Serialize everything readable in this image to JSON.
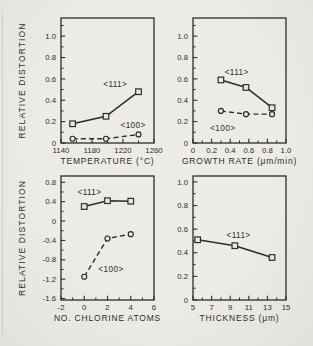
{
  "figure": {
    "background": "#eae8e3",
    "ink": "#2f2d29",
    "y_axis_title": "RELATIVE DISTORTION"
  },
  "chart_data": [
    {
      "id": "temperature",
      "type": "line",
      "title": "",
      "xlabel": "TEMPERATURE (°C)",
      "ylabel": "RELATIVE DISTORTION",
      "xlim": [
        1140,
        1260
      ],
      "ylim": [
        0,
        1.17
      ],
      "grid": false,
      "legend": "inline-annotations",
      "xticks_major": [
        1140,
        1180,
        1220,
        1260
      ],
      "xtick_labels": [
        "1140",
        "1180",
        "1220",
        "1260"
      ],
      "xticks_minor": [
        1160,
        1200,
        1240
      ],
      "yticks_major": [
        0,
        0.2,
        0.4,
        0.6,
        0.8,
        1.0
      ],
      "ytick_labels": [
        "0",
        "0.2",
        "0.4",
        "0.6",
        "0.8",
        "1.0"
      ],
      "yticks_minor": [
        0.1,
        0.3,
        0.5,
        0.7,
        0.9,
        1.1
      ],
      "series": [
        {
          "name": "<111>",
          "marker": "square",
          "dash": false,
          "x": [
            1155,
            1198,
            1240
          ],
          "y": [
            0.18,
            0.25,
            0.48
          ]
        },
        {
          "name": "<100>",
          "marker": "circle",
          "dash": true,
          "x": [
            1155,
            1198,
            1240
          ],
          "y": [
            0.04,
            0.04,
            0.08
          ]
        }
      ],
      "annotations": [
        {
          "text": "<111>",
          "x": 1210,
          "y": 0.55
        },
        {
          "text": "<100>",
          "x": 1233,
          "y": 0.17
        }
      ]
    },
    {
      "id": "growth-rate",
      "type": "line",
      "title": "",
      "xlabel": "GROWTH RATE (μm/min)",
      "ylabel": "",
      "xlim": [
        0,
        1.0
      ],
      "ylim": [
        0,
        1.17
      ],
      "grid": false,
      "legend": "inline-annotations",
      "xticks_major": [
        0,
        0.2,
        0.4,
        0.6,
        0.8,
        1.0
      ],
      "xtick_labels": [
        "0",
        "0.2",
        "0.4",
        "0.6",
        "0.8",
        "1.0"
      ],
      "xticks_minor": [
        0.1,
        0.3,
        0.5,
        0.7,
        0.9
      ],
      "yticks_major": [
        0,
        0.2,
        0.4,
        0.6,
        0.8,
        1.0
      ],
      "ytick_labels": [
        "0",
        "0.2",
        "0.4",
        "0.6",
        "0.8",
        "1.0"
      ],
      "yticks_minor": [
        0.1,
        0.3,
        0.5,
        0.7,
        0.9,
        1.1
      ],
      "series": [
        {
          "name": "<111>",
          "marker": "square",
          "dash": false,
          "x": [
            0.3,
            0.57,
            0.85
          ],
          "y": [
            0.59,
            0.52,
            0.33
          ]
        },
        {
          "name": "<100>",
          "marker": "circle",
          "dash": true,
          "x": [
            0.3,
            0.57,
            0.85
          ],
          "y": [
            0.3,
            0.27,
            0.27
          ]
        }
      ],
      "annotations": [
        {
          "text": "<111>",
          "x": 0.47,
          "y": 0.66
        },
        {
          "text": "<100>",
          "x": 0.32,
          "y": 0.135
        }
      ]
    },
    {
      "id": "chlorine-atoms",
      "type": "line",
      "title": "",
      "xlabel": "NO. CHLORINE ATOMS",
      "ylabel": "RELATIVE DISTORTION",
      "xlim": [
        -2,
        6
      ],
      "ylim": [
        -1.63,
        0.93
      ],
      "grid": false,
      "legend": "inline-annotations",
      "xticks_major": [
        -2,
        0,
        2,
        4,
        6
      ],
      "xtick_labels": [
        "-2",
        "0",
        "2",
        "4",
        "6"
      ],
      "xticks_minor": [
        -1,
        1,
        3,
        5
      ],
      "yticks_major": [
        0.8,
        0.4,
        0,
        -0.4,
        -0.8,
        -1.2,
        -1.6
      ],
      "ytick_labels": [
        "0.8",
        "0.4",
        "0",
        "-0.4",
        "-0.8",
        "-1.2",
        "-1.6"
      ],
      "yticks_minor": [
        0.6,
        0.2,
        -0.2,
        -0.6,
        -1.0,
        -1.4
      ],
      "series": [
        {
          "name": "<111>",
          "marker": "square",
          "dash": false,
          "x": [
            0,
            2,
            4
          ],
          "y": [
            0.3,
            0.42,
            0.41
          ]
        },
        {
          "name": "<100>",
          "marker": "circle",
          "dash": true,
          "x": [
            0,
            2,
            4
          ],
          "y": [
            -1.15,
            -0.36,
            -0.27
          ]
        }
      ],
      "annotations": [
        {
          "text": "<111>",
          "x": 0.45,
          "y": 0.6
        },
        {
          "text": "<100>",
          "x": 2.3,
          "y": -1.0
        }
      ]
    },
    {
      "id": "thickness",
      "type": "line",
      "title": "",
      "xlabel": "THICKNESS (μm)",
      "ylabel": "",
      "xlim": [
        5,
        15
      ],
      "ylim": [
        0,
        1.05
      ],
      "grid": false,
      "legend": "inline-annotations",
      "xticks_major": [
        5,
        7,
        9,
        11,
        13,
        15
      ],
      "xtick_labels": [
        "5",
        "7",
        "9",
        "11",
        "13",
        "15"
      ],
      "xticks_minor": [
        6,
        8,
        10,
        12,
        14
      ],
      "yticks_major": [
        0,
        0.2,
        0.4,
        0.6,
        0.8,
        1.0
      ],
      "ytick_labels": [
        "0",
        "0.2",
        "0.4",
        "0.6",
        "0.8",
        "1.0"
      ],
      "yticks_minor": [
        0.1,
        0.3,
        0.5,
        0.7,
        0.9
      ],
      "series": [
        {
          "name": "<111>",
          "marker": "square",
          "dash": false,
          "x": [
            5.5,
            9.5,
            13.5
          ],
          "y": [
            0.51,
            0.46,
            0.36
          ]
        }
      ],
      "annotations": [
        {
          "text": "<111>",
          "x": 9.9,
          "y": 0.55
        }
      ]
    }
  ]
}
